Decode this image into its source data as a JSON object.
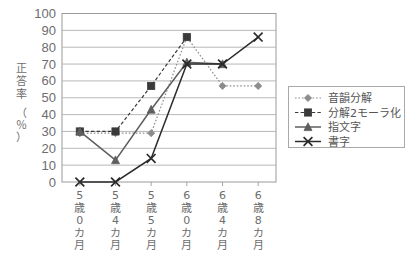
{
  "chart_data": {
    "type": "line",
    "title": "",
    "xlabel": "",
    "ylabel": "正答率（％）",
    "ylabel_main": "正答率",
    "ylabel_unit": "（％）",
    "ylim": [
      0,
      100
    ],
    "ytick_step": 10,
    "yticks": [
      "100",
      "90",
      "80",
      "70",
      "60",
      "50",
      "40",
      "30",
      "20",
      "10",
      "0"
    ],
    "grid": true,
    "grid_axis": "y",
    "legend_position": "right",
    "categories": [
      "5歳0カ月",
      "5歳4カ月",
      "5歳5カ月",
      "6歳0カ月",
      "6歳4カ月",
      "6歳8カ月"
    ],
    "categories_vertical": [
      [
        "5",
        "歳",
        "0",
        "カ",
        "月"
      ],
      [
        "5",
        "歳",
        "4",
        "カ",
        "月"
      ],
      [
        "5",
        "歳",
        "5",
        "カ",
        "月"
      ],
      [
        "6",
        "歳",
        "0",
        "カ",
        "月"
      ],
      [
        "6",
        "歳",
        "4",
        "カ",
        "月"
      ],
      [
        "6",
        "歳",
        "8",
        "カ",
        "月"
      ]
    ],
    "series": [
      {
        "name": "音韻分解",
        "marker": "diamond",
        "line_style": "dotted",
        "color": "#8c8c8c",
        "values": [
          29,
          29,
          29,
          86,
          57,
          57
        ]
      },
      {
        "name": "分解2モーラ化",
        "marker": "square",
        "line_style": "dashed",
        "color": "#3a3a3a",
        "values": [
          30,
          30,
          57,
          86,
          null,
          null
        ]
      },
      {
        "name": "指文字",
        "marker": "triangle",
        "line_style": "solid",
        "color": "#5e5e5e",
        "values": [
          30,
          13,
          43,
          71,
          70,
          null
        ]
      },
      {
        "name": "書字",
        "marker": "cross",
        "line_style": "solid",
        "color": "#2b2b2b",
        "values": [
          0,
          0,
          14,
          70,
          70,
          86
        ]
      }
    ]
  },
  "legend": {
    "entries": [
      {
        "label": "音韻分解"
      },
      {
        "label": "分解2モーラ化"
      },
      {
        "label": "指文字"
      },
      {
        "label": "書字"
      }
    ]
  },
  "colors": {
    "grid": "#b0b0b0",
    "frame": "#9a9a9a",
    "text": "#6d6d6d",
    "legend_border": "#a8a8a8",
    "background": "#ffffff"
  }
}
